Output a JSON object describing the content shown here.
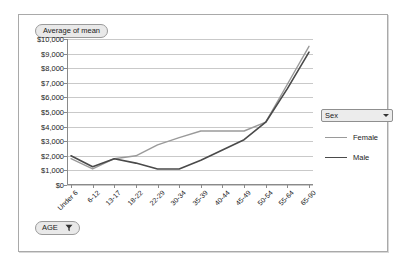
{
  "title_button": {
    "label": "Average of mean"
  },
  "age_button": {
    "label": "AGE",
    "icon": "filter-funnel-icon"
  },
  "legend": {
    "field_label": "Sex",
    "dropdown_icon": "chevron-down-icon",
    "entries": [
      {
        "label": "Female",
        "color": "#9a9a9a"
      },
      {
        "label": "Male",
        "color": "#4a4a4a"
      }
    ]
  },
  "chart_data": {
    "type": "line",
    "title": "Average of mean",
    "xlabel": "AGE",
    "ylabel": "",
    "grid": true,
    "legend_position": "right",
    "ylim": [
      0,
      10000
    ],
    "ytick_labels": [
      "$0",
      "$1,000",
      "$2,000",
      "$3,000",
      "$4,000",
      "$5,000",
      "$6,000",
      "$7,000",
      "$8,000",
      "$9,000",
      "$10,000"
    ],
    "ytick_values": [
      0,
      1000,
      2000,
      3000,
      4000,
      5000,
      6000,
      7000,
      8000,
      9000,
      10000
    ],
    "categories": [
      "Under 6",
      "6-12",
      "13-17",
      "18-22",
      "22-29",
      "30-34",
      "35-39",
      "40-44",
      "45-49",
      "50-54",
      "55-64",
      "65-90"
    ],
    "series": [
      {
        "name": "Female",
        "color": "#9a9a9a",
        "values": [
          1800,
          1100,
          1800,
          2000,
          2750,
          3250,
          3700,
          3700,
          3700,
          4300,
          6900,
          9500
        ]
      },
      {
        "name": "Male",
        "color": "#4a4a4a",
        "values": [
          2000,
          1250,
          1800,
          1500,
          1100,
          1100,
          1700,
          2400,
          3100,
          4300,
          6600,
          9100
        ]
      }
    ]
  }
}
